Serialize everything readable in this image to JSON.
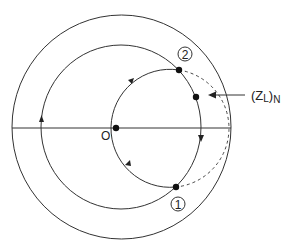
{
  "diagram": {
    "labels": {
      "origin": "O",
      "point1": "1",
      "point2": "2",
      "load_main": "(Z",
      "load_sub": "L",
      "load_close": ")",
      "load_norm": "N"
    },
    "colors": {
      "stroke": "#333333",
      "background": "#ffffff"
    }
  }
}
